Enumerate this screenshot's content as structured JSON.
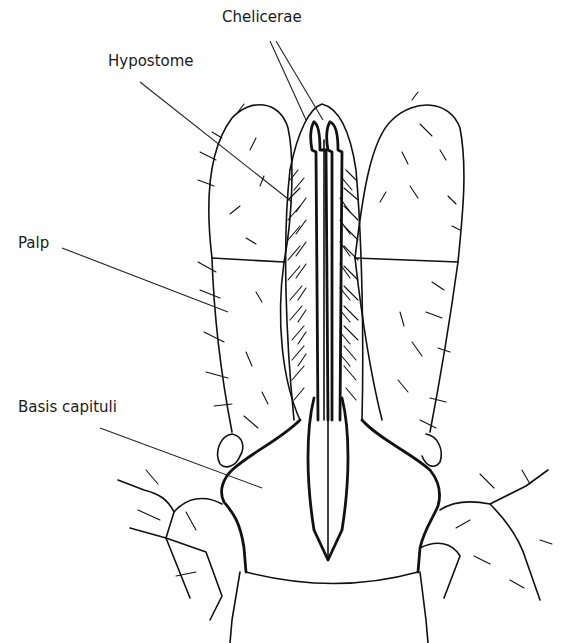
{
  "figure": {
    "background": "#ffffff",
    "line_color": "#111111"
  },
  "labels": [
    {
      "id": "chelicerae",
      "text": "Chelicerae",
      "x": 289,
      "y": 8
    },
    {
      "id": "hypostome",
      "text": "Hypostome",
      "x": 108,
      "y": 52
    },
    {
      "id": "palp",
      "text": "Palp",
      "x": 18,
      "y": 234
    },
    {
      "id": "basis_capituli",
      "text": "Basis capituli",
      "x": 18,
      "y": 398
    }
  ],
  "leaders": {
    "chelicerae": [
      [
        270,
        41,
        306,
        120
      ],
      [
        276,
        41,
        323,
        120
      ]
    ],
    "hypostome": [
      [
        140,
        82,
        292,
        202
      ]
    ],
    "palp": [
      [
        62,
        248,
        228,
        312
      ]
    ],
    "basis_capituli": [
      [
        100,
        428,
        262,
        488
      ]
    ]
  }
}
